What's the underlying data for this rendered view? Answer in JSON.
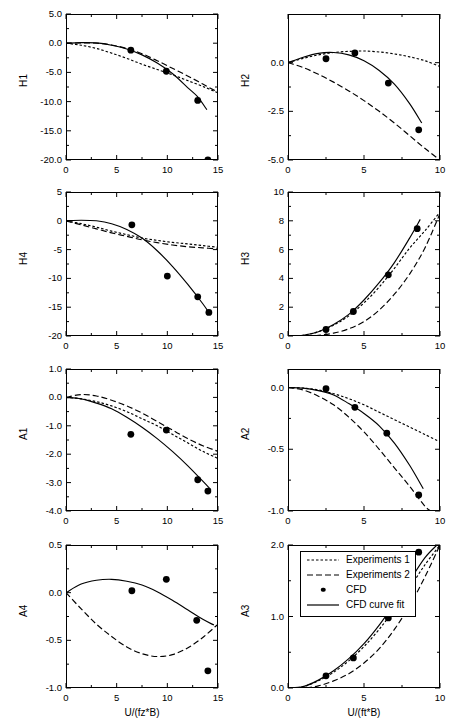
{
  "figure": {
    "legend": {
      "entries": [
        {
          "label": "Experiments 1",
          "style": "dotted"
        },
        {
          "label": "Experiments 2",
          "style": "dashed"
        },
        {
          "label": "CFD",
          "style": "marker"
        },
        {
          "label": "CFD curve fit",
          "style": "solid"
        }
      ]
    },
    "xlabel_left": "U/(fz*B)",
    "xlabel_right": "U/(ft*B)"
  },
  "chart_data": [
    {
      "type": "scatter",
      "title": "",
      "ylabel": "H1",
      "xlabel": "U/(fz*B)",
      "xlim": [
        0,
        15
      ],
      "ylim": [
        -20,
        5
      ],
      "xticks": [
        0,
        5,
        10,
        15
      ],
      "xticklabels": [
        "0",
        "5",
        "10",
        "15"
      ],
      "yticks": [
        5,
        0,
        -5,
        -10,
        -15,
        -20
      ],
      "yticklabels": [
        "5.0",
        "0.0",
        "-5.0",
        "-10.0",
        "-15.0",
        "-20.0"
      ],
      "grid": false,
      "series": [
        {
          "name": "Experiments 1",
          "style": "dotted",
          "x": [
            0,
            1.5,
            3,
            4.5,
            6,
            7.5,
            9,
            10.5,
            12,
            13.5,
            15
          ],
          "y": [
            0.0,
            -0.35,
            -0.9,
            -1.7,
            -2.6,
            -3.6,
            -4.5,
            -5.4,
            -6.4,
            -7.4,
            -8.5
          ]
        },
        {
          "name": "Experiments 2",
          "style": "dashed",
          "x": [
            0,
            1.5,
            3,
            4.5,
            6,
            7.5,
            9,
            10.5,
            12,
            13.5,
            15
          ],
          "y": [
            0.0,
            0.05,
            0.0,
            -0.3,
            -0.9,
            -1.8,
            -3.0,
            -4.3,
            -5.6,
            -7.0,
            -8.4
          ]
        },
        {
          "name": "CFD curve fit",
          "style": "solid",
          "x": [
            0,
            1.5,
            3,
            4.5,
            6,
            7.5,
            9,
            10.5,
            12,
            13.0,
            13.9
          ],
          "y": [
            0.0,
            0.1,
            0.05,
            -0.35,
            -1.0,
            -2.0,
            -3.4,
            -5.2,
            -7.6,
            -9.2,
            -11.4
          ]
        },
        {
          "name": "CFD",
          "style": "marker",
          "x": [
            6.4,
            9.9,
            13.0,
            14.0
          ],
          "y": [
            -1.2,
            -4.8,
            -9.8,
            -20.0
          ]
        }
      ]
    },
    {
      "type": "scatter",
      "title": "",
      "ylabel": "H2",
      "xlabel": "U/(ft*B)",
      "xlim": [
        0,
        10
      ],
      "ylim": [
        -5.0,
        2.5
      ],
      "xticks": [
        0,
        5,
        10
      ],
      "xticklabels": [
        "0",
        "5",
        "10"
      ],
      "yticks": [
        0.0,
        -2.5,
        -5.0
      ],
      "yticklabels": [
        "0.0",
        "-2.5",
        "-5.0"
      ],
      "grid": false,
      "series": [
        {
          "name": "Experiments 1",
          "style": "dotted",
          "x": [
            0,
            1,
            2,
            3,
            4,
            5,
            6,
            7,
            8,
            9,
            10
          ],
          "y": [
            0.0,
            0.22,
            0.4,
            0.52,
            0.58,
            0.6,
            0.55,
            0.45,
            0.3,
            0.1,
            -0.2
          ]
        },
        {
          "name": "Experiments 2",
          "style": "dashed",
          "x": [
            0,
            1,
            2,
            3,
            4,
            5,
            6,
            7,
            8,
            9,
            10
          ],
          "y": [
            0.0,
            -0.25,
            -0.6,
            -1.0,
            -1.45,
            -1.95,
            -2.5,
            -3.1,
            -3.75,
            -4.4,
            -5.0
          ]
        },
        {
          "name": "CFD curve fit",
          "style": "solid",
          "x": [
            0,
            1,
            2,
            3,
            4,
            5,
            6,
            7,
            8,
            8.8
          ],
          "y": [
            0.0,
            0.28,
            0.48,
            0.52,
            0.4,
            0.1,
            -0.4,
            -1.1,
            -2.1,
            -3.1
          ]
        },
        {
          "name": "CFD",
          "style": "marker",
          "x": [
            2.5,
            4.4,
            6.6,
            8.6
          ],
          "y": [
            0.2,
            0.5,
            -1.05,
            -3.45
          ]
        }
      ]
    },
    {
      "type": "scatter",
      "title": "",
      "ylabel": "H4",
      "xlabel": "U/(fz*B)",
      "xlim": [
        0,
        15
      ],
      "ylim": [
        -20,
        5
      ],
      "xticks": [
        0,
        5,
        10,
        15
      ],
      "xticklabels": [
        "0",
        "5",
        "10",
        "15"
      ],
      "yticks": [
        5,
        0,
        -5,
        -10,
        -15,
        -20
      ],
      "yticklabels": [
        "5",
        "0",
        "-5",
        "-10",
        "-15",
        "-20"
      ],
      "grid": false,
      "series": [
        {
          "name": "Experiments 1",
          "style": "dotted",
          "x": [
            0,
            1.5,
            3,
            4.5,
            6,
            7.5,
            9,
            10.5,
            12,
            13.5,
            15
          ],
          "y": [
            0.0,
            -0.5,
            -1.1,
            -1.8,
            -2.4,
            -3.0,
            -3.4,
            -3.75,
            -4.0,
            -4.3,
            -4.6
          ]
        },
        {
          "name": "Experiments 2",
          "style": "dashed",
          "x": [
            0,
            1.5,
            3,
            4.5,
            6,
            7.5,
            9,
            10.5,
            12,
            13.5,
            15
          ],
          "y": [
            0.0,
            -0.7,
            -1.4,
            -2.1,
            -2.7,
            -3.3,
            -3.8,
            -4.2,
            -4.5,
            -4.7,
            -4.9
          ]
        },
        {
          "name": "CFD curve fit",
          "style": "solid",
          "x": [
            0,
            1.5,
            3,
            4.5,
            6,
            7.5,
            9,
            10.5,
            12,
            13.5,
            14.2
          ],
          "y": [
            0.0,
            0.1,
            0.0,
            -0.5,
            -1.5,
            -3.0,
            -5.2,
            -7.9,
            -11.0,
            -14.4,
            -16.2
          ]
        },
        {
          "name": "CFD",
          "style": "marker",
          "x": [
            6.5,
            10.0,
            13.0,
            14.1
          ],
          "y": [
            -0.7,
            -9.6,
            -13.2,
            -15.9
          ]
        }
      ]
    },
    {
      "type": "scatter",
      "title": "",
      "ylabel": "H3",
      "xlabel": "U/(ft*B)",
      "xlim": [
        0,
        10
      ],
      "ylim": [
        0,
        10
      ],
      "xticks": [
        0,
        5,
        10
      ],
      "xticklabels": [
        "0",
        "5",
        "10"
      ],
      "yticks": [
        0,
        2,
        4,
        6,
        8,
        10
      ],
      "yticklabels": [
        "0",
        "2",
        "4",
        "6",
        "8",
        "10"
      ],
      "grid": false,
      "series": [
        {
          "name": "Experiments 1",
          "style": "dotted",
          "x": [
            0,
            1,
            2,
            3,
            4,
            5,
            6,
            7,
            8,
            9,
            10
          ],
          "y": [
            0.0,
            0.05,
            0.3,
            0.75,
            1.4,
            2.3,
            3.4,
            4.7,
            6.1,
            7.3,
            8.6
          ]
        },
        {
          "name": "Experiments 2",
          "style": "dashed",
          "x": [
            0,
            1,
            2,
            3,
            4,
            5,
            6,
            7,
            8,
            9,
            10
          ],
          "y": [
            0.0,
            0.0,
            0.05,
            0.2,
            0.5,
            1.0,
            1.8,
            2.9,
            4.3,
            6.1,
            8.5
          ]
        },
        {
          "name": "CFD curve fit",
          "style": "solid",
          "x": [
            0,
            1,
            2,
            3,
            4,
            5,
            6,
            7,
            8,
            8.7
          ],
          "y": [
            0.0,
            0.05,
            0.3,
            0.8,
            1.5,
            2.5,
            3.7,
            5.1,
            6.8,
            8.1
          ]
        },
        {
          "name": "CFD",
          "style": "marker",
          "x": [
            2.5,
            4.3,
            6.6,
            8.5
          ],
          "y": [
            0.45,
            1.7,
            4.25,
            7.45
          ]
        }
      ]
    },
    {
      "type": "scatter",
      "title": "",
      "ylabel": "A1",
      "xlabel": "U/(fz*B)",
      "xlim": [
        0,
        15
      ],
      "ylim": [
        -4.0,
        1.0
      ],
      "xticks": [
        0,
        5,
        10,
        15
      ],
      "xticklabels": [
        "0",
        "5",
        "10",
        "15"
      ],
      "yticks": [
        1.0,
        0.0,
        -1.0,
        -2.0,
        -3.0,
        -4.0
      ],
      "yticklabels": [
        "1.0",
        "0.0",
        "-1.0",
        "-2.0",
        "-3.0",
        "-4.0"
      ],
      "grid": false,
      "series": [
        {
          "name": "Experiments 1",
          "style": "dotted",
          "x": [
            0,
            1.5,
            3,
            4.5,
            6,
            7.5,
            9,
            10.5,
            12,
            13.5,
            15
          ],
          "y": [
            0.0,
            -0.05,
            -0.15,
            -0.3,
            -0.5,
            -0.75,
            -1.0,
            -1.3,
            -1.6,
            -1.9,
            -2.15
          ]
        },
        {
          "name": "Experiments 2",
          "style": "dashed",
          "x": [
            0,
            1.5,
            3,
            4.5,
            6,
            7.5,
            9,
            10.5,
            12,
            13.5,
            15
          ],
          "y": [
            0.0,
            0.1,
            0.05,
            -0.1,
            -0.3,
            -0.55,
            -0.85,
            -1.15,
            -1.45,
            -1.7,
            -1.9
          ]
        },
        {
          "name": "CFD curve fit",
          "style": "solid",
          "x": [
            0,
            1.5,
            3,
            4.5,
            6,
            7.5,
            9,
            10.5,
            12,
            13.5,
            14.3
          ],
          "y": [
            0.0,
            -0.05,
            -0.2,
            -0.4,
            -0.7,
            -1.05,
            -1.45,
            -1.9,
            -2.4,
            -2.95,
            -3.25
          ]
        },
        {
          "name": "CFD",
          "style": "marker",
          "x": [
            6.4,
            9.9,
            13.0,
            14.0
          ],
          "y": [
            -1.3,
            -1.15,
            -2.9,
            -3.3
          ]
        }
      ]
    },
    {
      "type": "scatter",
      "title": "",
      "ylabel": "A2",
      "xlabel": "U/(ft*B)",
      "xlim": [
        0,
        10
      ],
      "ylim": [
        -1.0,
        0.15
      ],
      "xticks": [
        0,
        5,
        10
      ],
      "xticklabels": [
        "0",
        "5",
        "10"
      ],
      "yticks": [
        0.0,
        -0.5,
        -1.0
      ],
      "yticklabels": [
        "0.0",
        "-0.5",
        "-1.0"
      ],
      "grid": false,
      "series": [
        {
          "name": "Experiments 1",
          "style": "dotted",
          "x": [
            0,
            1,
            2,
            3,
            4,
            5,
            6,
            7,
            8,
            9,
            10
          ],
          "y": [
            0.0,
            -0.005,
            -0.02,
            -0.05,
            -0.09,
            -0.14,
            -0.2,
            -0.26,
            -0.32,
            -0.38,
            -0.44
          ]
        },
        {
          "name": "Experiments 2",
          "style": "dashed",
          "x": [
            0,
            1,
            2,
            3,
            4,
            5,
            6,
            7,
            8,
            9,
            9.4
          ],
          "y": [
            0.0,
            -0.02,
            -0.07,
            -0.14,
            -0.24,
            -0.36,
            -0.5,
            -0.65,
            -0.8,
            -0.96,
            -1.0
          ]
        },
        {
          "name": "CFD curve fit",
          "style": "solid",
          "x": [
            0,
            1,
            2,
            3,
            4,
            5,
            6,
            7,
            8,
            8.9
          ],
          "y": [
            0.0,
            -0.005,
            -0.025,
            -0.06,
            -0.13,
            -0.21,
            -0.31,
            -0.45,
            -0.63,
            -0.82
          ]
        },
        {
          "name": "CFD",
          "style": "marker",
          "x": [
            2.5,
            4.4,
            6.5,
            8.6
          ],
          "y": [
            -0.01,
            -0.16,
            -0.37,
            -0.87
          ]
        }
      ]
    },
    {
      "type": "scatter",
      "title": "",
      "ylabel": "A4",
      "xlabel": "U/(fz*B)",
      "xlim": [
        0,
        15
      ],
      "ylim": [
        -1.0,
        0.5
      ],
      "xticks": [
        0,
        5,
        10,
        15
      ],
      "xticklabels": [
        "0",
        "5",
        "10",
        "15"
      ],
      "yticks": [
        0.5,
        0.0,
        -0.5,
        -1.0
      ],
      "yticklabels": [
        "0.5",
        "0.0",
        "-0.5",
        "-1.0"
      ],
      "grid": false,
      "series": [
        {
          "name": "Experiments 2",
          "style": "dashed",
          "x": [
            0,
            1.5,
            3,
            4.5,
            6,
            7.5,
            9,
            10.5,
            12,
            13.5,
            15
          ],
          "y": [
            0.0,
            -0.17,
            -0.33,
            -0.46,
            -0.57,
            -0.64,
            -0.67,
            -0.65,
            -0.58,
            -0.47,
            -0.33
          ]
        },
        {
          "name": "CFD curve fit",
          "style": "solid",
          "x": [
            0,
            1.5,
            3,
            4.5,
            6,
            7.5,
            9,
            10.5,
            12,
            13.5,
            14.6
          ],
          "y": [
            0.0,
            0.09,
            0.13,
            0.14,
            0.12,
            0.08,
            0.01,
            -0.08,
            -0.18,
            -0.28,
            -0.34
          ]
        },
        {
          "name": "CFD",
          "style": "marker",
          "x": [
            6.5,
            9.9,
            12.9,
            14.0
          ],
          "y": [
            0.02,
            0.14,
            -0.29,
            -0.82
          ]
        }
      ]
    },
    {
      "type": "scatter",
      "title": "",
      "ylabel": "A3",
      "xlabel": "U/(ft*B)",
      "xlim": [
        0,
        10
      ],
      "ylim": [
        0.0,
        2.0
      ],
      "xticks": [
        0,
        5,
        10
      ],
      "xticklabels": [
        "0",
        "5",
        "10"
      ],
      "yticks": [
        2.0,
        1.0,
        0.0
      ],
      "yticklabels": [
        "2.0",
        "1.0",
        "0.0"
      ],
      "grid": false,
      "series": [
        {
          "name": "Experiments 1",
          "style": "dotted",
          "x": [
            0,
            1,
            2,
            3,
            4,
            5,
            6,
            7,
            8,
            9,
            10
          ],
          "y": [
            0.0,
            0.02,
            0.1,
            0.22,
            0.38,
            0.58,
            0.82,
            1.1,
            1.4,
            1.72,
            2.0
          ]
        },
        {
          "name": "Experiments 2",
          "style": "dashed",
          "x": [
            0,
            1,
            2,
            3,
            4,
            5,
            6,
            7,
            8,
            9,
            10
          ],
          "y": [
            0.0,
            0.0,
            0.03,
            0.1,
            0.2,
            0.35,
            0.55,
            0.82,
            1.15,
            1.55,
            2.0
          ]
        },
        {
          "name": "CFD curve fit",
          "style": "solid",
          "x": [
            0,
            1,
            2,
            3,
            4,
            5,
            6,
            7,
            8,
            9,
            9.8
          ],
          "y": [
            0.0,
            0.02,
            0.11,
            0.24,
            0.41,
            0.62,
            0.88,
            1.18,
            1.5,
            1.82,
            2.0
          ]
        },
        {
          "name": "CFD",
          "style": "marker",
          "x": [
            2.5,
            4.3,
            6.6,
            8.6
          ],
          "y": [
            0.17,
            0.42,
            0.98,
            1.9
          ]
        }
      ]
    }
  ]
}
